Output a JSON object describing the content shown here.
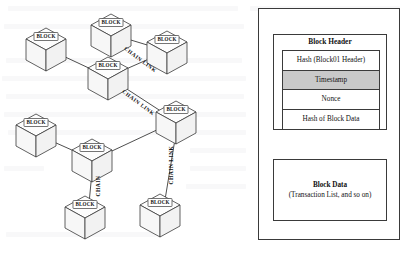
{
  "figure": {
    "background_color": "#ffffff",
    "ink_color": "#3a3a3a"
  },
  "network": {
    "node_label": "BLOCK",
    "nodes": [
      {
        "id": "n1",
        "label": "BLOCK",
        "x": 46,
        "y": 44
      },
      {
        "id": "n2",
        "label": "BLOCK",
        "x": 111,
        "y": 30
      },
      {
        "id": "n3",
        "label": "BLOCK",
        "x": 167,
        "y": 47
      },
      {
        "id": "n4",
        "label": "BLOCK",
        "x": 108,
        "y": 73
      },
      {
        "id": "n5",
        "label": "BLOCK",
        "x": 176,
        "y": 117
      },
      {
        "id": "n6",
        "label": "BLOCK",
        "x": 36,
        "y": 130
      },
      {
        "id": "n7",
        "label": "BLOCK",
        "x": 92,
        "y": 155
      },
      {
        "id": "n8",
        "label": "BLOCK",
        "x": 85,
        "y": 212
      },
      {
        "id": "n9",
        "label": "BLOCK",
        "x": 160,
        "y": 210
      }
    ],
    "edges": [
      {
        "from": "n1",
        "to": "n4"
      },
      {
        "from": "n2",
        "to": "n3"
      },
      {
        "from": "n3",
        "to": "n4"
      },
      {
        "from": "n4",
        "to": "n5"
      },
      {
        "from": "n6",
        "to": "n7"
      },
      {
        "from": "n7",
        "to": "n5"
      },
      {
        "from": "n7",
        "to": "n8"
      },
      {
        "from": "n5",
        "to": "n9"
      }
    ],
    "edge_labels": [
      {
        "text": "CHAIN  LINK",
        "x": 140,
        "y": 60,
        "rotate": 37
      },
      {
        "text": "CHAIN  LINK",
        "x": 138,
        "y": 103,
        "rotate": 37
      },
      {
        "text": "CHAIN  LINK",
        "x": 172,
        "y": 165,
        "rotate": -90
      },
      {
        "text": "CHAIN",
        "x": 99,
        "y": 186,
        "rotate": -90
      }
    ]
  },
  "block_panel": {
    "header": {
      "title": "Block Header",
      "rows": [
        {
          "label": "Hash (Block01 Header)",
          "shaded": false
        },
        {
          "label": "Timestamp",
          "shaded": true
        },
        {
          "label": "Nonce",
          "shaded": false
        },
        {
          "label": "Hash of Block Data",
          "shaded": false
        }
      ],
      "shaded_row_color": "#c9c9c9"
    },
    "block_data": {
      "title": "Block Data",
      "subtitle": "(Transaction List, and so on)"
    }
  }
}
